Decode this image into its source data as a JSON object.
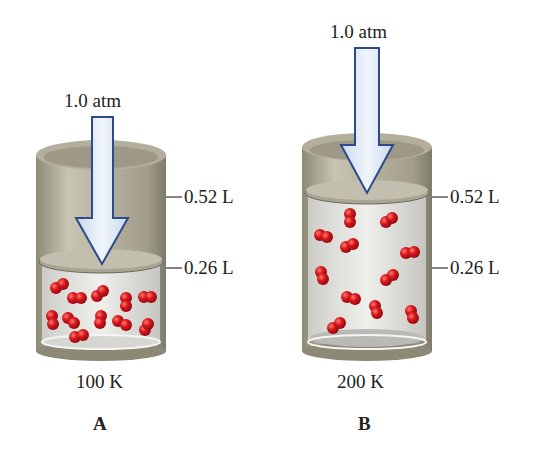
{
  "panels": [
    {
      "id": "A",
      "letter": "A",
      "temperature": "100 K",
      "pressure": "1.0 atm",
      "volume_marks": [
        "0.52 L",
        "0.26 L"
      ],
      "gas_volume": "0.26 L",
      "molecule_count": 13
    },
    {
      "id": "B",
      "letter": "B",
      "temperature": "200 K",
      "pressure": "1.0 atm",
      "volume_marks": [
        "0.52 L",
        "0.26 L"
      ],
      "gas_volume": "0.52 L",
      "molecule_count": 13
    }
  ],
  "colors": {
    "cylinder": "#b5b09d",
    "cylinder_dark": "#8a8675",
    "arrow_fill": "#dfe9f6",
    "arrow_stroke": "#2d4a8a",
    "molecule": "#d0161b",
    "gas_bg": "#e4e4e2"
  }
}
